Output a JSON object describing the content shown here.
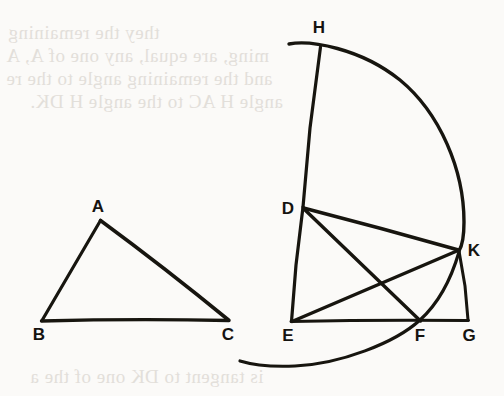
{
  "page": {
    "width": 504,
    "height": 396,
    "background_color": "#fbfaf8",
    "ink_color": "#17150f",
    "ghost_text_color": "#cfc9c2"
  },
  "ghost_text": {
    "note": "Faint bleed-through text from the reverse side of the page, mirrored and barely legible",
    "top_lines": [
      {
        "id": "ghost-top-1",
        "text": "they                      the remaining",
        "x": 8,
        "y": 22,
        "size": 19
      },
      {
        "id": "ghost-top-2",
        "text": "ming, are equal, any one of A, A",
        "x": 6,
        "y": 45,
        "size": 19
      },
      {
        "id": "ghost-top-3",
        "text": "and the remaining angle to the re",
        "x": 6,
        "y": 68,
        "size": 19
      },
      {
        "id": "ghost-top-4",
        "text": "angle H AC to the angle H DK.",
        "x": 30,
        "y": 91,
        "size": 19
      }
    ],
    "bottom_lines": [
      {
        "id": "ghost-bottom-1",
        "text": "is tangent to DK one of the a",
        "x": 30,
        "y": 366,
        "size": 19
      }
    ]
  },
  "figures": [
    {
      "name": "triangle-abc",
      "type": "triangle",
      "vertices": [
        {
          "label": "A",
          "x": 100,
          "y": 220,
          "label_x": 98,
          "label_y": 212
        },
        {
          "label": "B",
          "x": 42,
          "y": 320,
          "label_x": 37,
          "label_y": 338
        },
        {
          "label": "C",
          "x": 228,
          "y": 320,
          "label_x": 225,
          "label_y": 338
        }
      ],
      "edges": [
        {
          "id": "edge-ab",
          "from": "A",
          "to": "B"
        },
        {
          "id": "edge-ac",
          "from": "A",
          "to": "C"
        },
        {
          "id": "edge-bc",
          "from": "B",
          "to": "C"
        }
      ]
    },
    {
      "name": "sector-defghk",
      "type": "circular-sector-construction",
      "vertices": [
        {
          "label": "H",
          "x": 320,
          "y": 47,
          "label_x": 318,
          "label_y": 30
        },
        {
          "label": "D",
          "x": 303,
          "y": 207,
          "label_x": 288,
          "label_y": 214
        },
        {
          "label": "K",
          "x": 458,
          "y": 250,
          "label_x": 470,
          "label_y": 250
        },
        {
          "label": "E",
          "x": 291,
          "y": 322,
          "label_x": 286,
          "label_y": 340
        },
        {
          "label": "F",
          "x": 420,
          "y": 320,
          "label_x": 417,
          "label_y": 340
        },
        {
          "label": "G",
          "x": 468,
          "y": 320,
          "label_x": 465,
          "label_y": 340
        }
      ],
      "edges": [
        {
          "id": "edge-hd",
          "from": "H",
          "to": "D"
        },
        {
          "id": "edge-de",
          "from": "D",
          "to": "E"
        },
        {
          "id": "edge-dk",
          "from": "D",
          "to": "K"
        },
        {
          "id": "edge-df",
          "from": "D",
          "to": "F"
        },
        {
          "id": "edge-ek",
          "from": "E",
          "to": "K"
        },
        {
          "id": "edge-eg",
          "from": "E",
          "to": "G"
        },
        {
          "id": "edge-kg",
          "from": "K",
          "to": "G"
        }
      ],
      "arcs": [
        {
          "id": "arc-outer-hk",
          "description": "large arc from above H curving right and down through K",
          "from": "H",
          "to": "K"
        },
        {
          "id": "arc-inner-kf",
          "description": "arc from K down through F continuing left below the baseline",
          "from": "K",
          "to": "F"
        }
      ]
    }
  ]
}
